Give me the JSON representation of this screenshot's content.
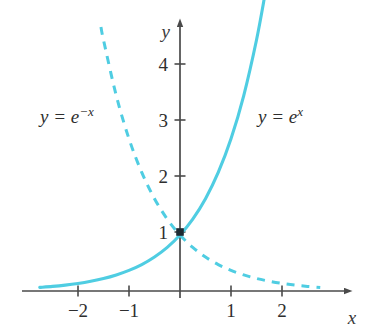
{
  "figure": {
    "title": "",
    "axis_labels": {
      "x": "x",
      "y": "y"
    },
    "curve_labels": {
      "left": {
        "lhs": "y = e",
        "exponent": "−x",
        "full": "y = e^{-x}"
      },
      "right": {
        "lhs": "y = e",
        "exponent": "x",
        "full": "y = e^{x}"
      }
    },
    "point_label": "1",
    "colors": {
      "curve": "#4FCDE2",
      "axis": "#4a4a4a",
      "text": "#2e2e2e",
      "background": "#ffffff"
    }
  },
  "chart_data": {
    "type": "line",
    "title": "",
    "xlabel": "x",
    "ylabel": "y",
    "xlim": [
      -2.9,
      3.0
    ],
    "ylim": [
      -0.35,
      4.9
    ],
    "xticks": [
      -2,
      -1,
      1,
      2
    ],
    "xtick_labels": [
      "−2",
      "−1",
      "1",
      "2"
    ],
    "yticks": [
      1,
      2,
      3,
      4
    ],
    "ytick_labels": [
      "1",
      "2",
      "3",
      "4"
    ],
    "grid": false,
    "legend": "inline-annotations",
    "annotations": [
      {
        "text": "y = e^{-x}",
        "x": -1.95,
        "y": 3.1
      },
      {
        "text": "y = e^{x}",
        "x": 1.75,
        "y": 3.1
      }
    ],
    "markers": [
      {
        "x": 0,
        "y": 1,
        "label": "1",
        "style": "filled-square"
      }
    ],
    "series": [
      {
        "name": "y = e^x",
        "style": "solid",
        "color": "#4FCDE2",
        "x_range": [
          -2.75,
          1.67
        ],
        "points": [
          [
            -2.75,
            0.064
          ],
          [
            -2.5,
            0.082
          ],
          [
            -2.25,
            0.105
          ],
          [
            -2.0,
            0.135
          ],
          [
            -1.75,
            0.174
          ],
          [
            -1.5,
            0.223
          ],
          [
            -1.25,
            0.287
          ],
          [
            -1.0,
            0.368
          ],
          [
            -0.75,
            0.472
          ],
          [
            -0.5,
            0.607
          ],
          [
            -0.25,
            0.779
          ],
          [
            0.0,
            1.0
          ],
          [
            0.25,
            1.284
          ],
          [
            0.5,
            1.649
          ],
          [
            0.75,
            2.117
          ],
          [
            1.0,
            2.718
          ],
          [
            1.25,
            3.49
          ],
          [
            1.5,
            4.482
          ],
          [
            1.67,
            5.312
          ]
        ]
      },
      {
        "name": "y = e^{-x}",
        "style": "dashed",
        "color": "#4FCDE2",
        "x_range": [
          -1.55,
          2.75
        ],
        "points": [
          [
            -1.55,
            4.715
          ],
          [
            -1.5,
            4.482
          ],
          [
            -1.25,
            3.49
          ],
          [
            -1.0,
            2.718
          ],
          [
            -0.75,
            2.117
          ],
          [
            -0.5,
            1.649
          ],
          [
            -0.25,
            1.284
          ],
          [
            0.0,
            1.0
          ],
          [
            0.25,
            0.779
          ],
          [
            0.5,
            0.607
          ],
          [
            0.75,
            0.472
          ],
          [
            1.0,
            0.368
          ],
          [
            1.25,
            0.287
          ],
          [
            1.5,
            0.223
          ],
          [
            1.75,
            0.174
          ],
          [
            2.0,
            0.135
          ],
          [
            2.25,
            0.105
          ],
          [
            2.5,
            0.082
          ],
          [
            2.75,
            0.064
          ]
        ]
      }
    ]
  }
}
